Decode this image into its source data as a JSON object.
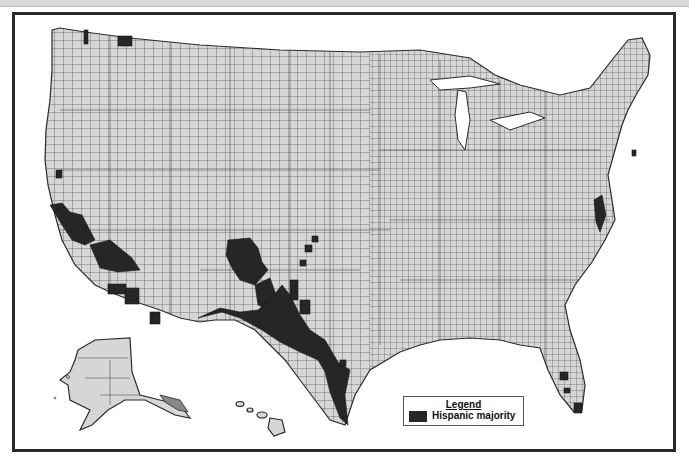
{
  "map": {
    "subject": "United States counties with Hispanic majority",
    "regions_shown": [
      "Contiguous United States",
      "Alaska",
      "Hawaii"
    ],
    "colors": {
      "background": "#ffffff",
      "non_majority_county": "#d6d6d6",
      "hispanic_majority_county": "#262626",
      "border": "#2b2b2b"
    }
  },
  "legend": {
    "title": "Legend",
    "items": [
      {
        "label": "Hispanic majority",
        "color": "#262626"
      }
    ]
  }
}
